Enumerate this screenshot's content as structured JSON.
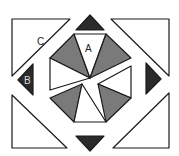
{
  "diagram": {
    "title": "",
    "colors": {
      "background": "#ffffff",
      "stroke": "#1a1a1a",
      "dark": "#2b2b2b",
      "grey": "#7a7a7a",
      "white": "#ffffff",
      "label_on_dark": "#d9d9d9",
      "label_on_light": "#222222"
    },
    "labels": {
      "A": "A",
      "B": "B",
      "C": "C"
    },
    "corner_triangles": [
      {
        "id": "top-left",
        "label": "C",
        "points": "12,19 70,19 12,76"
      },
      {
        "id": "top-right",
        "label": "",
        "points": "111,19 169,19 169,76"
      },
      {
        "id": "bottom-left",
        "label": "",
        "points": "12,95 12,148 67,148"
      },
      {
        "id": "bottom-right",
        "label": "",
        "points": "169,93 169,148 113,148"
      }
    ],
    "edge_triangles": [
      {
        "id": "top",
        "label": "",
        "points": "76,30 90,15 104,30"
      },
      {
        "id": "bottom",
        "label": "",
        "points": "76,136 104,136 90,151"
      },
      {
        "id": "left",
        "label": "B",
        "points": "33,64 33,95 18,80"
      },
      {
        "id": "right",
        "label": "",
        "points": "146,63 146,94 161,79"
      }
    ],
    "octagon_wedges": [
      {
        "id": "w-top-left",
        "shade": "grey",
        "points": "74,34 50,58 90,78"
      },
      {
        "id": "w-top",
        "shade": "white",
        "label": "A",
        "points": "74,34 106,34 90,78"
      },
      {
        "id": "w-top-right",
        "shade": "grey",
        "points": "106,34 131,58 90,78"
      },
      {
        "id": "w-left",
        "shade": "white",
        "points": "50,58 50,90 90,78"
      },
      {
        "id": "w-right",
        "shade": "white",
        "points": "131,66 131,98 98,84"
      },
      {
        "id": "w-bottom-left",
        "shade": "grey",
        "points": "50,98 82,84 74,122"
      },
      {
        "id": "w-bottom",
        "shade": "white",
        "points": "82,84 74,122 106,122"
      },
      {
        "id": "w-bottom-right",
        "shade": "grey",
        "points": "98,84 131,98 106,122"
      }
    ]
  }
}
